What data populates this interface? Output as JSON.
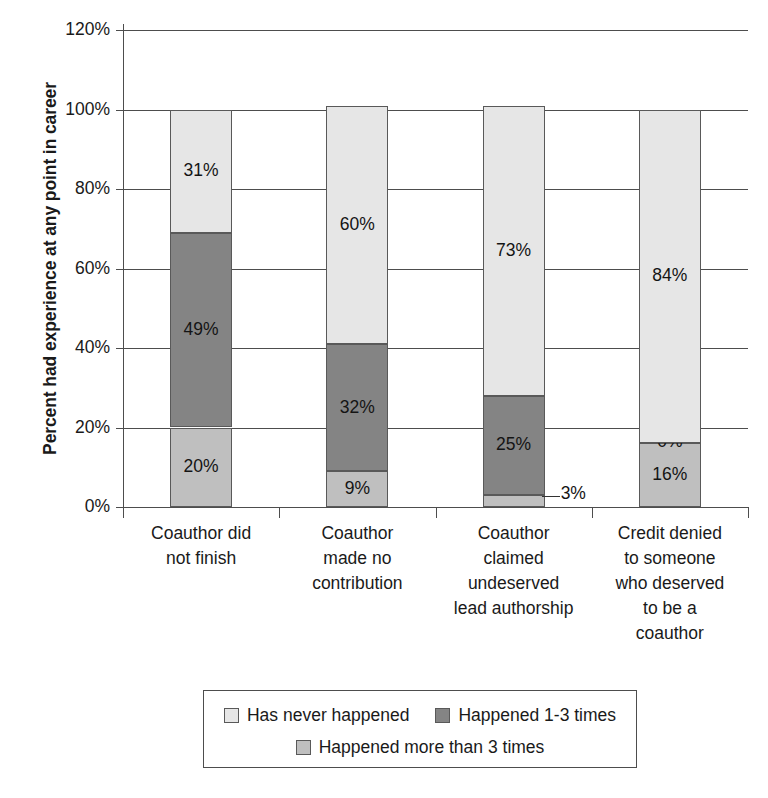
{
  "chart_data": {
    "type": "bar",
    "subtype": "stacked-bar-100",
    "title": "",
    "xlabel": "",
    "ylabel": "Percent had experience at any point in career",
    "ylim": [
      0,
      120
    ],
    "ytick_labels": [
      "0%",
      "20%",
      "40%",
      "60%",
      "80%",
      "100%",
      "120%"
    ],
    "ytick_values": [
      0,
      20,
      40,
      60,
      80,
      100,
      120
    ],
    "grid": true,
    "legend_position": "bottom",
    "categories": [
      "Coauthor did not finish",
      "Coauthor made no contribution",
      "Coauthor claimed undeserved lead authorship",
      "Credit denied to someone who deserved to be a coauthor"
    ],
    "category_lines": [
      [
        "Coauthor did",
        "not finish"
      ],
      [
        "Coauthor",
        "made no",
        "contribution"
      ],
      [
        "Coauthor",
        "claimed",
        "undeserved",
        "lead authorship"
      ],
      [
        "Credit denied",
        "to someone",
        "who deserved",
        "to be a",
        "coauthor"
      ]
    ],
    "series": [
      {
        "name": "Happened more than 3 times",
        "color": "#bfbfbf",
        "values": [
          20,
          9,
          3,
          16
        ],
        "labels": [
          "20%",
          "9%",
          "3%",
          "16%"
        ]
      },
      {
        "name": "Happened 1-3 times",
        "color": "#848484",
        "values": [
          49,
          32,
          25,
          0
        ],
        "labels": [
          "49%",
          "32%",
          "25%",
          "0%"
        ]
      },
      {
        "name": "Has never happened",
        "color": "#e6e6e6",
        "values": [
          31,
          60,
          73,
          84
        ],
        "labels": [
          "31%",
          "60%",
          "73%",
          "84%"
        ]
      }
    ]
  },
  "legend": {
    "items": [
      {
        "label": "Has never happened",
        "color": "#e6e6e6"
      },
      {
        "label": "Happened 1-3 times",
        "color": "#848484"
      },
      {
        "label": "Happened more than 3 times",
        "color": "#bfbfbf"
      }
    ]
  },
  "axis": {
    "y_title": "Percent had experience at any point in career"
  }
}
